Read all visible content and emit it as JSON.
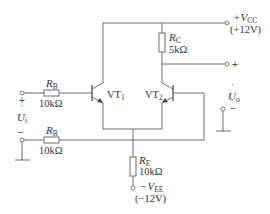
{
  "diagram": {
    "type": "differential amplifier circuit",
    "colors": {
      "line": "#6e6e6e",
      "text": "#333333",
      "background": "#ffffff"
    },
    "supply_positive": {
      "symbol": "+V",
      "subscript": "CC",
      "value": "(+12V)"
    },
    "supply_negative": {
      "symbol": "−V",
      "subscript": "EE",
      "value": "(−12V)"
    },
    "resistor_rc": {
      "symbol": "R",
      "subscript": "C",
      "value": "5kΩ"
    },
    "resistor_rb1": {
      "symbol": "R",
      "subscript": "B",
      "value": "10kΩ"
    },
    "resistor_rb2": {
      "symbol": "R",
      "subscript": "B",
      "value": "10kΩ"
    },
    "resistor_re": {
      "symbol": "R",
      "subscript": "E",
      "value": "10kΩ"
    },
    "transistor_1": {
      "symbol": "VT",
      "subscript": "1"
    },
    "transistor_2": {
      "symbol": "VT",
      "subscript": "2"
    },
    "input": {
      "symbol": "U",
      "dot": "˙",
      "subscript": "i",
      "plus": "+",
      "minus": "−"
    },
    "output": {
      "symbol": "U",
      "dot": "˙",
      "subscript": "o",
      "plus": "+",
      "minus": "−"
    }
  }
}
